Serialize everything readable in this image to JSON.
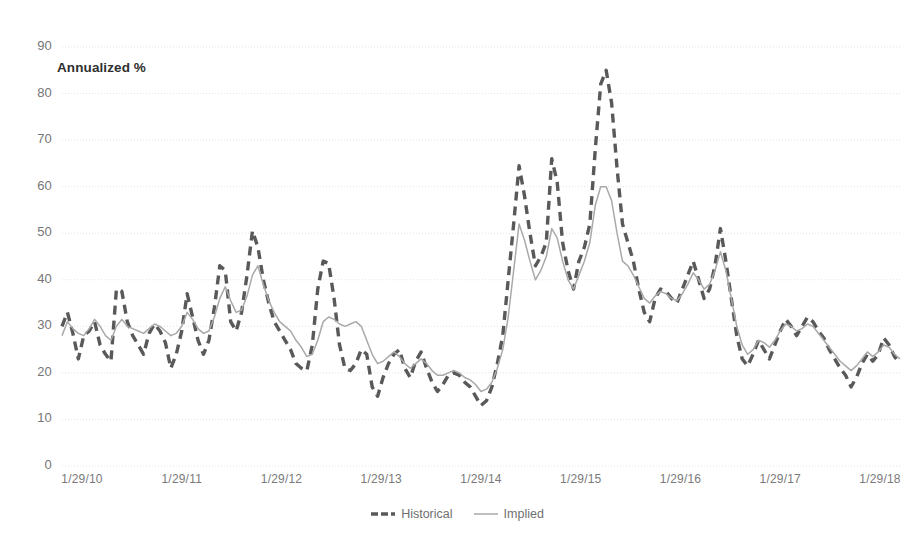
{
  "chart_data": {
    "type": "line",
    "title": "",
    "annotation": "Annualized %",
    "xlabel": "",
    "ylabel": "Annualized %",
    "ylim": [
      0,
      90
    ],
    "ytick_step": 10,
    "yticks": [
      0,
      10,
      20,
      30,
      40,
      50,
      60,
      70,
      80,
      90
    ],
    "xticks": [
      "1/29/10",
      "1/29/11",
      "1/29/12",
      "1/29/13",
      "1/29/14",
      "1/29/15",
      "1/29/16",
      "1/29/17",
      "1/29/18"
    ],
    "grid": true,
    "grid_axis": "y",
    "legend_position": "bottom",
    "x_start": "1/29/10",
    "x_end": "7/29/18",
    "n_points": 104,
    "series": [
      {
        "name": "Historical",
        "style": "dashed",
        "color": "#595959",
        "width": 3.4,
        "values": [
          30.0,
          33.0,
          28.5,
          23.0,
          28.0,
          29.0,
          31.0,
          26.0,
          24.0,
          22.5,
          38.0,
          37.5,
          31.0,
          28.0,
          26.0,
          24.0,
          28.5,
          30.5,
          29.0,
          26.5,
          21.0,
          24.0,
          29.0,
          37.0,
          32.0,
          27.0,
          24.0,
          27.0,
          34.0,
          43.0,
          42.0,
          31.0,
          29.0,
          33.0,
          41.0,
          50.5,
          47.0,
          40.0,
          35.0,
          31.0,
          29.0,
          27.0,
          25.0,
          22.0,
          21.0,
          20.5,
          26.0,
          38.0,
          44.0,
          43.5,
          36.0,
          26.0,
          21.0,
          20.5,
          22.0,
          25.0,
          24.0,
          17.0,
          15.0,
          19.0,
          22.0,
          24.0,
          25.0,
          21.0,
          19.0,
          22.5,
          24.5,
          21.0,
          18.0,
          16.0,
          17.5,
          19.5,
          20.0,
          19.5,
          18.0,
          17.0,
          15.0,
          13.0,
          14.0,
          17.0,
          22.0,
          28.0,
          40.0,
          52.0,
          64.5,
          58.0,
          50.0,
          43.0,
          45.0,
          48.0,
          66.0,
          61.0,
          48.0,
          42.0,
          38.0,
          44.0,
          47.0,
          52.0,
          68.0,
          82.0,
          85.0,
          78.0,
          64.0,
          52.0
        ]
      },
      {
        "name": "Implied",
        "style": "solid",
        "color": "#a9a9a9",
        "width": 1.5,
        "values": [
          28.0,
          31.0,
          29.5,
          28.5,
          28.0,
          29.5,
          31.5,
          30.0,
          28.0,
          27.0,
          30.0,
          31.5,
          30.0,
          29.5,
          29.0,
          28.5,
          29.5,
          30.5,
          30.0,
          29.0,
          28.0,
          28.5,
          30.0,
          33.0,
          31.5,
          29.5,
          28.5,
          29.0,
          32.0,
          36.0,
          38.5,
          35.5,
          33.0,
          33.5,
          36.5,
          41.0,
          43.0,
          39.0,
          35.5,
          33.0,
          31.0,
          30.0,
          29.0,
          27.0,
          25.5,
          23.5,
          24.0,
          27.0,
          31.0,
          32.0,
          31.5,
          30.5,
          30.0,
          30.5,
          31.0,
          30.0,
          27.0,
          24.0,
          22.0,
          22.5,
          23.5,
          24.5,
          23.5,
          22.0,
          21.0,
          22.0,
          23.0,
          22.0,
          20.5,
          19.5,
          19.5,
          20.0,
          20.5,
          20.0,
          19.0,
          18.5,
          17.5,
          16.0,
          16.5,
          18.0,
          21.0,
          25.0,
          32.0,
          42.0,
          52.0,
          48.5,
          44.0,
          40.0,
          42.0,
          45.0,
          51.0,
          49.0,
          44.0,
          40.0,
          38.0,
          41.0,
          44.0,
          48.0,
          56.0,
          60.0,
          60.0,
          57.0,
          50.0,
          44.0
        ]
      }
    ],
    "series_tail": [
      {
        "name": "Historical",
        "values": [
          48.0,
          44.0,
          38.0,
          33.0,
          31.0,
          36.0,
          38.0,
          37.5,
          36.0,
          35.0,
          38.0,
          41.0,
          44.0,
          40.0,
          36.0,
          38.0,
          43.0,
          51.0,
          44.0,
          36.0,
          28.0,
          23.0,
          21.5,
          24.0,
          27.0,
          25.0,
          23.0,
          26.0,
          29.0,
          31.5,
          30.0,
          28.0,
          30.0,
          32.0,
          31.0,
          29.0,
          27.5,
          25.0,
          23.0,
          21.0,
          19.5,
          17.0,
          19.0,
          22.0,
          24.0,
          22.5,
          24.0,
          27.5,
          26.0,
          23.5,
          22.0
        ]
      },
      {
        "name": "Implied",
        "values": [
          43.0,
          41.0,
          38.5,
          36.0,
          35.0,
          36.5,
          37.5,
          37.0,
          36.0,
          35.5,
          37.0,
          39.0,
          41.5,
          40.0,
          38.0,
          39.0,
          42.0,
          46.0,
          42.0,
          36.0,
          30.0,
          26.0,
          24.0,
          25.0,
          27.0,
          26.5,
          25.5,
          27.0,
          29.0,
          30.5,
          30.0,
          29.0,
          29.5,
          30.5,
          30.0,
          28.5,
          27.0,
          25.5,
          24.0,
          22.5,
          21.5,
          20.5,
          21.5,
          23.0,
          24.5,
          23.5,
          24.5,
          26.0,
          25.5,
          24.0,
          23.0
        ]
      }
    ]
  },
  "legend": {
    "items": [
      {
        "label": "Historical"
      },
      {
        "label": "Implied"
      }
    ]
  },
  "colors": {
    "historical": "#595959",
    "implied": "#a9a9a9",
    "grid": "#e3e3e3",
    "text": "#767676"
  }
}
